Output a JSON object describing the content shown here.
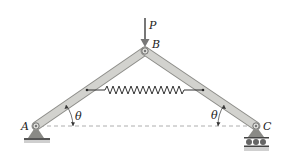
{
  "diagram": {
    "type": "mechanics-truss",
    "labels": {
      "load": "P",
      "joint_top": "B",
      "joint_left": "A",
      "joint_right": "C",
      "angle_left": "θ",
      "angle_right": "θ"
    },
    "joints": {
      "A": [
        36,
        126
      ],
      "B": [
        145,
        51
      ],
      "C": [
        256,
        126
      ]
    },
    "members": [
      {
        "from": "A",
        "to": "B"
      },
      {
        "from": "B",
        "to": "C"
      }
    ],
    "spring": {
      "from": [
        87,
        90
      ],
      "to": [
        203,
        90
      ],
      "coils": 10
    },
    "supports": {
      "A": "pin",
      "C": "roller"
    },
    "colors": {
      "member_fill": "#cfcfcb",
      "member_stroke": "#8e8e8a",
      "support": "#8a8a86",
      "line": "#333333",
      "dashed": "#888888"
    }
  }
}
